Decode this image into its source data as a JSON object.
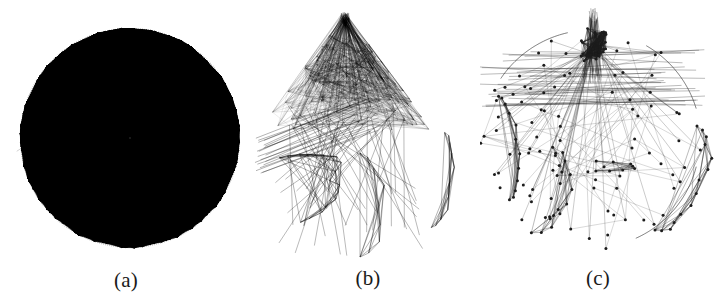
{
  "figure": {
    "background_color": "#ffffff",
    "ink_color": "#000000",
    "width": 724,
    "height": 308,
    "type": "graph-layout-comparison",
    "panel_count": 3
  },
  "panels": [
    {
      "id": "panel-a",
      "caption": "(a)",
      "layout_name": "circular-layout",
      "description": "Dense circular node-link layout, nodes on circle perimeter, near-complete edge set",
      "center_x": 130,
      "center_y": 138,
      "radius": 110,
      "node_count": 168,
      "edge_density": 0.92,
      "ink_color": "#000000",
      "edge_opacity": 0.55,
      "edge_width": 0.45,
      "show_nodes": false,
      "node_radius": 0,
      "seed": 10427,
      "style": "circle",
      "dark_cap": true
    },
    {
      "id": "panel-b",
      "caption": "(b)",
      "layout_name": "force-directed-layout",
      "description": "Dense triangular fan cluster with apex at top and sparse peripheral subgraphs",
      "center_x": 93,
      "center_y": 105,
      "radius": 105,
      "node_count": 150,
      "edge_density": 0.6,
      "ink_color": "#000000",
      "edge_opacity": 0.48,
      "edge_width": 0.45,
      "show_nodes": false,
      "node_radius": 0,
      "seed": 24881,
      "style": "fan",
      "apex_x": 93,
      "apex_y": 12,
      "cluster_spread": 88,
      "cluster_bottom": 130,
      "satellites": [
        {
          "name": "lower-left-arc",
          "cx": 38,
          "cy": 190,
          "rx": 52,
          "ry": 34,
          "nodes": 16,
          "rot": -18
        },
        {
          "name": "right-spindle",
          "cx": 186,
          "cy": 180,
          "rx": 14,
          "ry": 48,
          "nodes": 11,
          "rot": 8
        },
        {
          "name": "bottom-strands",
          "cx": 108,
          "cy": 205,
          "rx": 22,
          "ry": 52,
          "nodes": 9,
          "rot": 0
        }
      ]
    },
    {
      "id": "panel-c",
      "caption": "(c)",
      "layout_name": "radial-clustered-layout",
      "description": "Sparse radial layout with dark apex hub at top, visible node dots and circular boundary",
      "center_x": 112,
      "center_y": 140,
      "radius": 110,
      "node_count": 96,
      "edge_density": 0.16,
      "ink_color": "#1c1c1c",
      "edge_opacity": 0.55,
      "edge_width": 0.42,
      "show_nodes": true,
      "node_radius": 1.5,
      "seed": 77113,
      "style": "radial-sparse",
      "apex_x": 114,
      "apex_y": 42,
      "hub_nodes": 34,
      "satellites": [
        {
          "name": "left-fan",
          "cx": 24,
          "cy": 148,
          "rx": 14,
          "ry": 52,
          "nodes": 12,
          "rot": -6
        },
        {
          "name": "right-fan",
          "cx": 196,
          "cy": 178,
          "rx": 26,
          "ry": 56,
          "nodes": 14,
          "rot": 22
        },
        {
          "name": "lower-left-box",
          "cx": 62,
          "cy": 190,
          "rx": 26,
          "ry": 44,
          "nodes": 10,
          "rot": 14
        },
        {
          "name": "mid-chain",
          "cx": 116,
          "cy": 166,
          "rx": 40,
          "ry": 5,
          "nodes": 8,
          "rot": 2
        }
      ]
    }
  ],
  "captions": {
    "a": "(a)",
    "b": "(b)",
    "c": "(c)"
  }
}
